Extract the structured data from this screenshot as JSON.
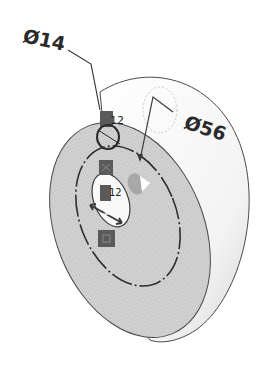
{
  "diagram": {
    "type": "cad-sketch",
    "dimensions": [
      {
        "id": "inner",
        "label": "Ø14",
        "symbol": "Ø",
        "value": "14"
      },
      {
        "id": "outer",
        "label": "Ø56",
        "symbol": "Ø",
        "value": "56"
      }
    ],
    "relations": [
      {
        "glyph": "coincident-icon",
        "text": "12"
      },
      {
        "glyph": "coincident-icon",
        "text": "12"
      }
    ],
    "colors": {
      "face": "#cfcfcf",
      "face_dark": "#bdbdbd",
      "rim": "#f2f2f2",
      "line": "#3a3a3a",
      "badge": "#5a5a5a",
      "background": "#ffffff"
    }
  }
}
